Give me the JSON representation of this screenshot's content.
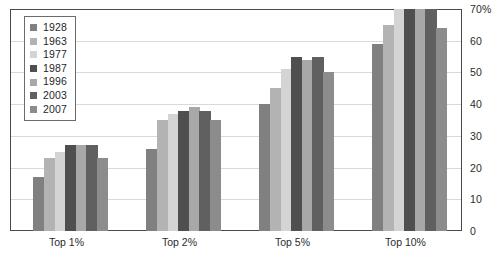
{
  "chart_data": {
    "type": "bar",
    "title": "",
    "xlabel": "",
    "ylabel": "",
    "ylim": [
      0,
      70
    ],
    "ytick_values": [
      0,
      10,
      20,
      30,
      40,
      50,
      60,
      70
    ],
    "ytick_labels": [
      "0",
      "10",
      "20",
      "30",
      "40",
      "50",
      "60",
      "70%"
    ],
    "yaxis_position": "right",
    "grid": true,
    "legend_position": "upper-left-inside",
    "categories": [
      "Top 1%",
      "Top 2%",
      "Top 5%",
      "Top 10%"
    ],
    "series": [
      {
        "name": "1928",
        "color": "#808080",
        "values": [
          17,
          26,
          40,
          59
        ]
      },
      {
        "name": "1963",
        "color": "#b3b3b3",
        "values": [
          23,
          35,
          45,
          65
        ]
      },
      {
        "name": "1977",
        "color": "#d4d4d4",
        "values": [
          25,
          37,
          51,
          70
        ]
      },
      {
        "name": "1987",
        "color": "#4f4f4f",
        "values": [
          27,
          38,
          55,
          71
        ]
      },
      {
        "name": "1996",
        "color": "#a8a8a8",
        "values": [
          27,
          39,
          54,
          71
        ]
      },
      {
        "name": "2003",
        "color": "#606060",
        "values": [
          27,
          38,
          55,
          70
        ]
      },
      {
        "name": "2007",
        "color": "#8c8c8c",
        "values": [
          23,
          35,
          50,
          64
        ]
      }
    ]
  },
  "legend": {
    "items": [
      {
        "label": "1928"
      },
      {
        "label": "1963"
      },
      {
        "label": "1977"
      },
      {
        "label": "1987"
      },
      {
        "label": "1996"
      },
      {
        "label": "2003"
      },
      {
        "label": "2007"
      }
    ]
  },
  "axes": {
    "y_labels": [
      "70%",
      "60",
      "50",
      "40",
      "30",
      "20",
      "10",
      "0"
    ],
    "x_labels": [
      "Top 1%",
      "Top 2%",
      "Top 5%",
      "Top 10%"
    ]
  }
}
